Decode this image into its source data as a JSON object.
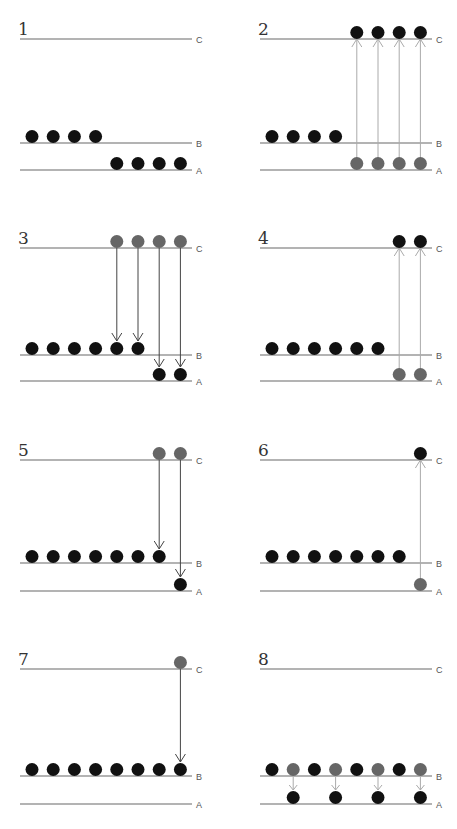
{
  "colors": {
    "filled_dot": "#111111",
    "excited_dot": "#666666",
    "level_line": "#9a9a9a",
    "arrow_up": "#aaaaaa",
    "arrow_down": "#444444"
  },
  "level_labels": {
    "C": "C",
    "B": "B",
    "A": "A"
  },
  "panels": [
    {
      "number": "1",
      "ox": 20,
      "ly": {
        "C": 39,
        "B": 143,
        "A": 170
      },
      "dots": [
        {
          "level": "B",
          "slot": 0,
          "tone": "dark"
        },
        {
          "level": "B",
          "slot": 1,
          "tone": "dark"
        },
        {
          "level": "B",
          "slot": 2,
          "tone": "dark"
        },
        {
          "level": "B",
          "slot": 3,
          "tone": "dark"
        },
        {
          "level": "A",
          "slot": 4,
          "tone": "dark"
        },
        {
          "level": "A",
          "slot": 5,
          "tone": "dark"
        },
        {
          "level": "A",
          "slot": 6,
          "tone": "dark"
        },
        {
          "level": "A",
          "slot": 7,
          "tone": "dark"
        }
      ],
      "arrows": []
    },
    {
      "number": "2",
      "ox": 260,
      "ly": {
        "C": 39,
        "B": 143,
        "A": 170
      },
      "dots": [
        {
          "level": "B",
          "slot": 0,
          "tone": "dark"
        },
        {
          "level": "B",
          "slot": 1,
          "tone": "dark"
        },
        {
          "level": "B",
          "slot": 2,
          "tone": "dark"
        },
        {
          "level": "B",
          "slot": 3,
          "tone": "dark"
        },
        {
          "level": "A",
          "slot": 4,
          "tone": "grey"
        },
        {
          "level": "A",
          "slot": 5,
          "tone": "grey"
        },
        {
          "level": "A",
          "slot": 6,
          "tone": "grey"
        },
        {
          "level": "A",
          "slot": 7,
          "tone": "grey"
        },
        {
          "level": "C",
          "slot": 4,
          "tone": "dark"
        },
        {
          "level": "C",
          "slot": 5,
          "tone": "dark"
        },
        {
          "level": "C",
          "slot": 6,
          "tone": "dark"
        },
        {
          "level": "C",
          "slot": 7,
          "tone": "dark"
        }
      ],
      "arrows": [
        {
          "slot": 4,
          "from": "A",
          "to": "C",
          "dir": "up"
        },
        {
          "slot": 5,
          "from": "A",
          "to": "C",
          "dir": "up"
        },
        {
          "slot": 6,
          "from": "A",
          "to": "C",
          "dir": "up"
        },
        {
          "slot": 7,
          "from": "A",
          "to": "C",
          "dir": "up"
        }
      ]
    },
    {
      "number": "3",
      "ox": 20,
      "ly": {
        "C": 248,
        "B": 355,
        "A": 381
      },
      "dots": [
        {
          "level": "C",
          "slot": 4,
          "tone": "grey"
        },
        {
          "level": "C",
          "slot": 5,
          "tone": "grey"
        },
        {
          "level": "C",
          "slot": 6,
          "tone": "grey"
        },
        {
          "level": "C",
          "slot": 7,
          "tone": "grey"
        },
        {
          "level": "B",
          "slot": 0,
          "tone": "dark"
        },
        {
          "level": "B",
          "slot": 1,
          "tone": "dark"
        },
        {
          "level": "B",
          "slot": 2,
          "tone": "dark"
        },
        {
          "level": "B",
          "slot": 3,
          "tone": "dark"
        },
        {
          "level": "B",
          "slot": 4,
          "tone": "dark"
        },
        {
          "level": "B",
          "slot": 5,
          "tone": "dark"
        },
        {
          "level": "A",
          "slot": 6,
          "tone": "dark"
        },
        {
          "level": "A",
          "slot": 7,
          "tone": "dark"
        }
      ],
      "arrows": [
        {
          "slot": 4,
          "from": "C",
          "to": "B",
          "dir": "down"
        },
        {
          "slot": 5,
          "from": "C",
          "to": "B",
          "dir": "down"
        },
        {
          "slot": 6,
          "from": "C",
          "to": "A",
          "dir": "down"
        },
        {
          "slot": 7,
          "from": "C",
          "to": "A",
          "dir": "down"
        }
      ]
    },
    {
      "number": "4",
      "ox": 260,
      "ly": {
        "C": 248,
        "B": 355,
        "A": 381
      },
      "dots": [
        {
          "level": "B",
          "slot": 0,
          "tone": "dark"
        },
        {
          "level": "B",
          "slot": 1,
          "tone": "dark"
        },
        {
          "level": "B",
          "slot": 2,
          "tone": "dark"
        },
        {
          "level": "B",
          "slot": 3,
          "tone": "dark"
        },
        {
          "level": "B",
          "slot": 4,
          "tone": "dark"
        },
        {
          "level": "B",
          "slot": 5,
          "tone": "dark"
        },
        {
          "level": "A",
          "slot": 6,
          "tone": "grey"
        },
        {
          "level": "A",
          "slot": 7,
          "tone": "grey"
        },
        {
          "level": "C",
          "slot": 6,
          "tone": "dark"
        },
        {
          "level": "C",
          "slot": 7,
          "tone": "dark"
        }
      ],
      "arrows": [
        {
          "slot": 6,
          "from": "A",
          "to": "C",
          "dir": "up"
        },
        {
          "slot": 7,
          "from": "A",
          "to": "C",
          "dir": "up"
        }
      ]
    },
    {
      "number": "5",
      "ox": 20,
      "ly": {
        "C": 460,
        "B": 563,
        "A": 591
      },
      "dots": [
        {
          "level": "C",
          "slot": 6,
          "tone": "grey"
        },
        {
          "level": "C",
          "slot": 7,
          "tone": "grey"
        },
        {
          "level": "B",
          "slot": 0,
          "tone": "dark"
        },
        {
          "level": "B",
          "slot": 1,
          "tone": "dark"
        },
        {
          "level": "B",
          "slot": 2,
          "tone": "dark"
        },
        {
          "level": "B",
          "slot": 3,
          "tone": "dark"
        },
        {
          "level": "B",
          "slot": 4,
          "tone": "dark"
        },
        {
          "level": "B",
          "slot": 5,
          "tone": "dark"
        },
        {
          "level": "B",
          "slot": 6,
          "tone": "dark"
        },
        {
          "level": "A",
          "slot": 7,
          "tone": "dark"
        }
      ],
      "arrows": [
        {
          "slot": 6,
          "from": "C",
          "to": "B",
          "dir": "down"
        },
        {
          "slot": 7,
          "from": "C",
          "to": "A",
          "dir": "down"
        }
      ]
    },
    {
      "number": "6",
      "ox": 260,
      "ly": {
        "C": 460,
        "B": 563,
        "A": 591
      },
      "dots": [
        {
          "level": "B",
          "slot": 0,
          "tone": "dark"
        },
        {
          "level": "B",
          "slot": 1,
          "tone": "dark"
        },
        {
          "level": "B",
          "slot": 2,
          "tone": "dark"
        },
        {
          "level": "B",
          "slot": 3,
          "tone": "dark"
        },
        {
          "level": "B",
          "slot": 4,
          "tone": "dark"
        },
        {
          "level": "B",
          "slot": 5,
          "tone": "dark"
        },
        {
          "level": "B",
          "slot": 6,
          "tone": "dark"
        },
        {
          "level": "A",
          "slot": 7,
          "tone": "grey"
        },
        {
          "level": "C",
          "slot": 7,
          "tone": "dark"
        }
      ],
      "arrows": [
        {
          "slot": 7,
          "from": "A",
          "to": "C",
          "dir": "up"
        }
      ]
    },
    {
      "number": "7",
      "ox": 20,
      "ly": {
        "C": 669,
        "B": 776,
        "A": 804
      },
      "dots": [
        {
          "level": "C",
          "slot": 7,
          "tone": "grey"
        },
        {
          "level": "B",
          "slot": 0,
          "tone": "dark"
        },
        {
          "level": "B",
          "slot": 1,
          "tone": "dark"
        },
        {
          "level": "B",
          "slot": 2,
          "tone": "dark"
        },
        {
          "level": "B",
          "slot": 3,
          "tone": "dark"
        },
        {
          "level": "B",
          "slot": 4,
          "tone": "dark"
        },
        {
          "level": "B",
          "slot": 5,
          "tone": "dark"
        },
        {
          "level": "B",
          "slot": 6,
          "tone": "dark"
        },
        {
          "level": "B",
          "slot": 7,
          "tone": "dark"
        }
      ],
      "arrows": [
        {
          "slot": 7,
          "from": "C",
          "to": "B",
          "dir": "down"
        }
      ]
    },
    {
      "number": "8",
      "ox": 260,
      "ly": {
        "C": 669,
        "B": 776,
        "A": 804
      },
      "dots": [
        {
          "level": "B",
          "slot": 0,
          "tone": "dark"
        },
        {
          "level": "B",
          "slot": 1,
          "tone": "grey"
        },
        {
          "level": "B",
          "slot": 2,
          "tone": "dark"
        },
        {
          "level": "B",
          "slot": 3,
          "tone": "grey"
        },
        {
          "level": "B",
          "slot": 4,
          "tone": "dark"
        },
        {
          "level": "B",
          "slot": 5,
          "tone": "grey"
        },
        {
          "level": "B",
          "slot": 6,
          "tone": "dark"
        },
        {
          "level": "B",
          "slot": 7,
          "tone": "grey"
        },
        {
          "level": "A",
          "slot": 1,
          "tone": "dark"
        },
        {
          "level": "A",
          "slot": 3,
          "tone": "dark"
        },
        {
          "level": "A",
          "slot": 5,
          "tone": "dark"
        },
        {
          "level": "A",
          "slot": 7,
          "tone": "dark"
        }
      ],
      "arrows": [
        {
          "slot": 1,
          "from": "B",
          "to": "A",
          "dir": "down",
          "light": true
        },
        {
          "slot": 3,
          "from": "B",
          "to": "A",
          "dir": "down",
          "light": true
        },
        {
          "slot": 5,
          "from": "B",
          "to": "A",
          "dir": "down",
          "light": true
        },
        {
          "slot": 7,
          "from": "B",
          "to": "A",
          "dir": "down",
          "light": true
        }
      ]
    }
  ]
}
